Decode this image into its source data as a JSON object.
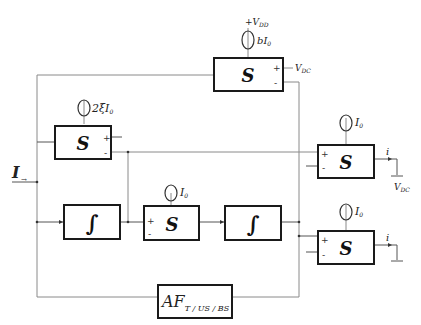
{
  "diagram": {
    "type": "block-diagram",
    "input": {
      "label": "I",
      "subscript": "→"
    },
    "blocks": [
      {
        "id": "s-top",
        "label": "S",
        "source": {
          "label": "bI",
          "sub": "0",
          "supply": "+V",
          "supply_sub": "DD"
        },
        "pin_plus": "+",
        "pin_minus": "-",
        "ref": "V",
        "ref_sub": "DC"
      },
      {
        "id": "s-left",
        "label": "S",
        "source": {
          "label": "2ξI",
          "sub": "0"
        },
        "pin_plus": "+",
        "pin_minus": "-"
      },
      {
        "id": "int-1",
        "label": "∫"
      },
      {
        "id": "s-mid",
        "label": "S",
        "source": {
          "label": "I",
          "sub": "0"
        },
        "pin_plus": "+",
        "pin_minus": "-"
      },
      {
        "id": "int-2",
        "label": "∫"
      },
      {
        "id": "s-out1",
        "label": "S",
        "source": {
          "label": "I",
          "sub": "0"
        },
        "pin_plus": "+",
        "pin_minus": "-",
        "output": "i",
        "ref": "V",
        "ref_sub": "DC"
      },
      {
        "id": "s-out2",
        "label": "S",
        "source": {
          "label": "I",
          "sub": "0"
        },
        "pin_plus": "+",
        "pin_minus": "-",
        "output": "i"
      },
      {
        "id": "af",
        "label": "AF",
        "sub": "T / US / BS"
      }
    ]
  }
}
